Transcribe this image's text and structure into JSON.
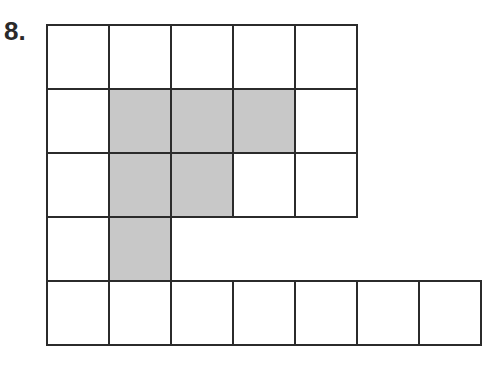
{
  "problem_number": "8.",
  "grid": {
    "origin_x": 47,
    "origin_y": 25,
    "cell_w": 62,
    "cell_h": 64,
    "rows": [
      [
        "white",
        "white",
        "white",
        "white",
        "white"
      ],
      [
        "white",
        "gray",
        "gray",
        "gray",
        "white"
      ],
      [
        "white",
        "gray",
        "gray",
        "white",
        "white"
      ],
      [
        "white",
        "gray"
      ],
      [
        "white",
        "white",
        "white",
        "white",
        "white",
        "white",
        "white"
      ]
    ]
  },
  "colors": {
    "shaded": "#c8c8c8",
    "line": "#2b2b2b",
    "background": "#ffffff"
  }
}
